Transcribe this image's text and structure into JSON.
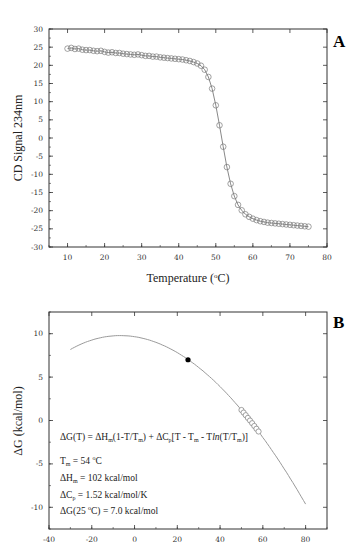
{
  "chart_data": [
    {
      "panel": "A",
      "type": "scatter",
      "title": "",
      "xlabel": "Temperature (°C)",
      "ylabel": "CD Signal 234nm",
      "xlim": [
        5,
        80
      ],
      "ylim": [
        -30,
        30
      ],
      "xticks": [
        10,
        20,
        30,
        40,
        50,
        60,
        70,
        80
      ],
      "yticks": [
        30,
        25,
        20,
        15,
        10,
        5,
        0,
        -5,
        -10,
        -15,
        -20,
        -25,
        -30
      ],
      "grid": false,
      "series": [
        {
          "name": "CD data (open circles) with sigmoidal fit line",
          "x": [
            10,
            11,
            12,
            13,
            14,
            15,
            16,
            17,
            18,
            19,
            20,
            21,
            22,
            23,
            24,
            25,
            26,
            27,
            28,
            29,
            30,
            31,
            32,
            33,
            34,
            35,
            36,
            37,
            38,
            39,
            40,
            41,
            42,
            43,
            44,
            45,
            46,
            47,
            48,
            49,
            50,
            51,
            52,
            53,
            54,
            55,
            56,
            57,
            58,
            59,
            60,
            61,
            62,
            63,
            64,
            65,
            66,
            67,
            68,
            69,
            70,
            71,
            72,
            73,
            74,
            75
          ],
          "y": [
            24.6,
            24.8,
            24.5,
            24.6,
            24.3,
            24.2,
            24.2,
            24.0,
            23.9,
            24.0,
            23.7,
            23.5,
            23.6,
            23.4,
            23.4,
            23.2,
            23.1,
            23.0,
            22.9,
            23.0,
            22.8,
            22.6,
            22.6,
            22.4,
            22.4,
            22.2,
            22.1,
            22.0,
            21.9,
            21.8,
            21.7,
            21.6,
            21.4,
            21.2,
            20.9,
            20.5,
            19.9,
            18.8,
            16.8,
            13.6,
            9.0,
            3.5,
            -2.4,
            -8.0,
            -12.6,
            -16.0,
            -18.4,
            -19.9,
            -21.0,
            -21.7,
            -22.2,
            -22.6,
            -22.9,
            -23.1,
            -23.3,
            -23.4,
            -23.5,
            -23.6,
            -23.7,
            -23.8,
            -23.9,
            -24.0,
            -24.1,
            -24.2,
            -24.3,
            -24.4
          ]
        }
      ]
    },
    {
      "panel": "B",
      "type": "line",
      "title": "",
      "xlabel": "",
      "ylabel": "ΔG (kcal/mol)",
      "xlim": [
        -40,
        90
      ],
      "ylim": [
        -12.5,
        12.5
      ],
      "xticks": [
        -40,
        -20,
        0,
        20,
        40,
        60,
        80
      ],
      "yticks": [
        10,
        5,
        0,
        -5,
        -10
      ],
      "grid": false,
      "model": {
        "Tm_C": 54,
        "dHm": 102,
        "dCp": 1.52
      },
      "series": [
        {
          "name": "ΔG(T) fit curve",
          "x": [
            -30,
            -20,
            -10,
            0,
            10,
            20,
            25,
            30,
            40,
            50,
            60,
            70,
            80
          ],
          "y": [
            8.2,
            9.4,
            9.98,
            9.99,
            9.45,
            8.32,
            7.0,
            6.52,
            4.37,
            1.21,
            -2.0,
            -5.7,
            -9.6
          ]
        },
        {
          "name": "experimental points (open circles)",
          "x": [
            50,
            51,
            52,
            53,
            54,
            55,
            56,
            57,
            58
          ],
          "y": [
            1.21,
            0.91,
            0.61,
            0.3,
            0.0,
            -0.31,
            -0.63,
            -0.95,
            -1.27
          ]
        },
        {
          "name": "ΔG at 25 °C (filled circle)",
          "x": [
            25
          ],
          "y": [
            7.0
          ]
        }
      ],
      "annotations": [
        "ΔG(T) = ΔHm(1-T/Tm) + ΔCp[T - Tm - Tln(T/Tm)]",
        "Tm = 54 °C",
        "ΔHm = 102 kcal/mol",
        "ΔCp = 1.52 kcal/mol/K",
        "ΔG(25 °C) = 7.0 kcal/mol"
      ]
    }
  ],
  "panelA": {
    "label": "A",
    "xlabel_main": "Temperature (",
    "xlabel_deg": "o",
    "xlabel_end": "C)",
    "ylabel": "CD Signal 234nm"
  },
  "panelB": {
    "label": "B",
    "ylabel": "ΔG (kcal/mol)",
    "eq": {
      "p1": "ΔG(T) = ΔH",
      "s1": "m",
      "p2": "(1-T/T",
      "s2": "m",
      "p3": ") + ΔC",
      "s3": "p",
      "p4": "[T - T",
      "s4": "m",
      "p5": " - T",
      "p5i": "ln",
      "p6": "(T/T",
      "s6": "m",
      "p7": ")]"
    },
    "tm": {
      "a": "T",
      "s": "m",
      "b": " = 54 ",
      "deg": "o",
      "c": "C"
    },
    "dh": {
      "a": "ΔH",
      "s": "m",
      "b": " = 102 kcal/mol"
    },
    "dcp": {
      "a": "ΔC",
      "s": "p",
      "b": " = 1.52 kcal/mol/K"
    },
    "dg": {
      "a": "ΔG(25 ",
      "deg": "o",
      "b": "C) = 7.0 kcal/mol"
    }
  },
  "colors": {
    "axis": "#333333",
    "line": "#9a9a9a",
    "marker": "#7a7a7a",
    "filled": "#000000"
  }
}
